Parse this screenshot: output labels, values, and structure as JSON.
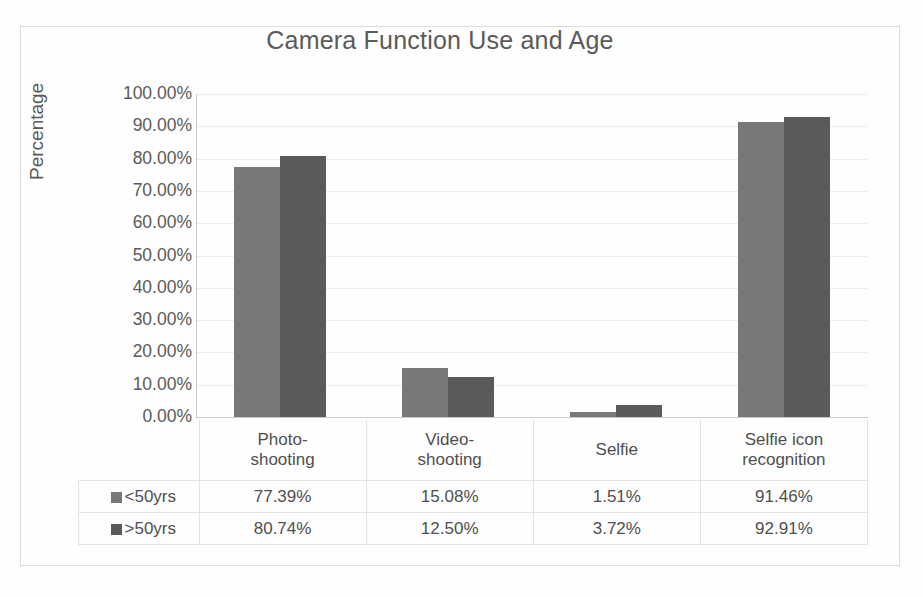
{
  "chart_data": {
    "type": "bar",
    "title": "Camera Function Use and Age",
    "xlabel": "",
    "ylabel": "Percentage",
    "categories": [
      "Photo-shooting",
      "Video-shooting",
      "Selfie",
      "Selfie icon recognition"
    ],
    "category_lines": [
      [
        "Photo-",
        "shooting"
      ],
      [
        "Video-",
        "shooting"
      ],
      [
        "Selfie",
        ""
      ],
      [
        "Selfie icon",
        "recognition"
      ]
    ],
    "series": [
      {
        "name": "<50yrs",
        "color": "#787878",
        "values": [
          77.39,
          15.08,
          1.51,
          91.46
        ],
        "labels": [
          "77.39%",
          "15.08%",
          "1.51%",
          "91.46%"
        ]
      },
      {
        "name": ">50yrs",
        "color": "#5a5a5a",
        "values": [
          80.74,
          12.5,
          3.72,
          92.91
        ],
        "labels": [
          "80.74%",
          "12.50%",
          "3.72%",
          "92.91%"
        ]
      }
    ],
    "ylim": [
      0,
      100
    ],
    "ytick_values": [
      100,
      90,
      80,
      70,
      60,
      50,
      40,
      30,
      20,
      10,
      0
    ],
    "ytick_labels": [
      "100.00%",
      "90.00%",
      "80.00%",
      "70.00%",
      "60.00%",
      "50.00%",
      "40.00%",
      "30.00%",
      "20.00%",
      "10.00%",
      "0.00%"
    ],
    "grid": true,
    "legend_position": "data-table",
    "has_data_table": true
  },
  "colors": {
    "series_1": "#787878",
    "series_2": "#5a5a5a",
    "gridline": "#ededed",
    "axis": "#c9c9c9",
    "frame_border": "#dcdcdc",
    "background": "#fdfdfc",
    "text": "#4f4f4f"
  }
}
